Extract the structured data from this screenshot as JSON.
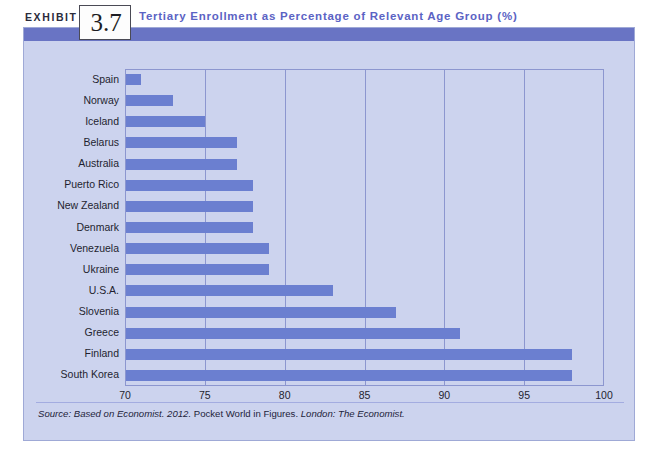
{
  "exhibit": {
    "label": "EXHIBIT",
    "number": "3.7",
    "title": "Tertiary Enrollment as Percentage of Relevant Age Group (%)"
  },
  "source": {
    "prefix": "Source: Based on Economist. 2012.",
    "middle": "Pocket World in Figures.",
    "suffix": "London: The Economist."
  },
  "colors": {
    "bar": "#6b7fd0",
    "panel_background": "#ccd3ee",
    "header_band": "#6974c4",
    "title_text": "#5b63c4",
    "gridline": "#8c96cf",
    "axis_text": "#1f1f30"
  },
  "chart_data": {
    "type": "bar",
    "orientation": "horizontal",
    "title": "Tertiary Enrollment as Percentage of Relevant Age Group (%)",
    "xlabel": "",
    "ylabel": "",
    "xlim": [
      70,
      100
    ],
    "xticks": [
      70,
      75,
      80,
      85,
      90,
      95,
      100
    ],
    "ticklabels": [
      "70",
      "75",
      "80",
      "85",
      "90",
      "95",
      "100"
    ],
    "grid": true,
    "legend": false,
    "categories": [
      "Spain",
      "Norway",
      "Iceland",
      "Belarus",
      "Australia",
      "Puerto Rico",
      "New Zealand",
      "Denmark",
      "Venezuela",
      "Ukraine",
      "U.S.A.",
      "Slovenia",
      "Greece",
      "Finland",
      "South Korea"
    ],
    "values": [
      71,
      73,
      75,
      77,
      77,
      78,
      78,
      78,
      79,
      79,
      83,
      87,
      91,
      98,
      98
    ]
  }
}
